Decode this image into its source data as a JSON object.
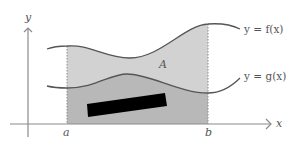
{
  "diagram": {
    "type": "area-between-curves",
    "axes": {
      "x_label": "x",
      "y_label": "y",
      "color": "#8a8a8a"
    },
    "bounds": {
      "a_label": "a",
      "b_label": "b"
    },
    "curves": [
      {
        "id": "f",
        "label": "y = f(x)",
        "color": "#555555"
      },
      {
        "id": "g",
        "label": "y = g(x)",
        "color": "#555555"
      }
    ],
    "region": {
      "label": "A",
      "fill_between": "#d2d2d2",
      "fill_below_g": "#b8b8b8"
    },
    "redaction": {
      "color": "#000000"
    }
  }
}
